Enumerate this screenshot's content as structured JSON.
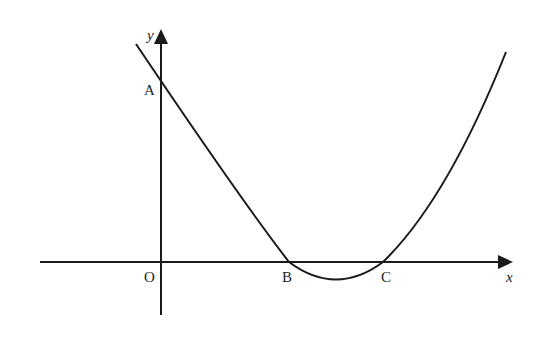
{
  "diagram": {
    "type": "parabola-graph",
    "axes": {
      "x_label": "x",
      "y_label": "y",
      "origin_label": "O"
    },
    "points": [
      {
        "label": "A",
        "description": "y-intercept of curve"
      },
      {
        "label": "B",
        "description": "first x-intercept"
      },
      {
        "label": "C",
        "description": "second x-intercept"
      }
    ],
    "colors": {
      "line": "#1a1a1a",
      "background": "#ffffff"
    }
  }
}
